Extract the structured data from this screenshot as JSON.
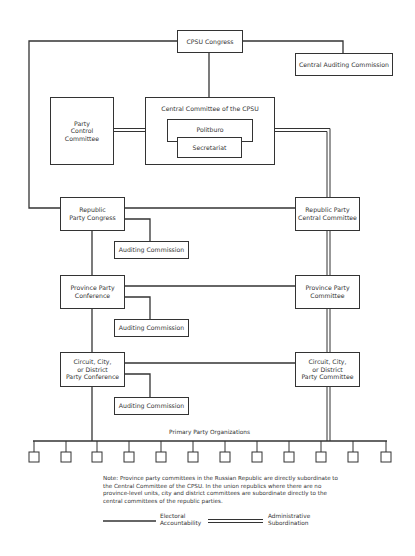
{
  "diagram": {
    "nodes": {
      "cpsu_congress": "CPSU Congress",
      "central_auditing_commission": "Central Auditing Commission",
      "party_control_committee": "Party\nControl\nCommittee",
      "central_committee": "Central Committee of the CPSU",
      "politburo": "Politburo",
      "secretariat": "Secretariat",
      "republic_party_congress": "Republic\nParty Congress",
      "republic_auditing_commission": "Auditing Commission",
      "republic_party_central_committee": "Republic Party\nCentral Committee",
      "province_party_conference": "Province Party\nConference",
      "province_auditing_commission": "Auditing Commission",
      "province_party_committee": "Province Party\nCommittee",
      "district_party_conference": "Circuit, City,\nor District\nParty Conference",
      "district_auditing_commission": "Auditing Commission",
      "district_party_committee": "Circuit, City,\nor District\nParty Committee",
      "primary_party_organizations": "Primary Party Organizations"
    },
    "primary_org_count": 12,
    "note": "Note: Province party committees in the Russian Republic are directly subordinate to the Central Committee of the CPSU. In the union republics where there are no province-level units, city and district committees are subordinate directly to the central committees of the republic parties.",
    "legend": {
      "electoral": "Electoral\nAccountability",
      "administrative": "Administrative\nSubordination"
    },
    "colors": {
      "line": "#333333",
      "background": "#ffffff"
    }
  }
}
